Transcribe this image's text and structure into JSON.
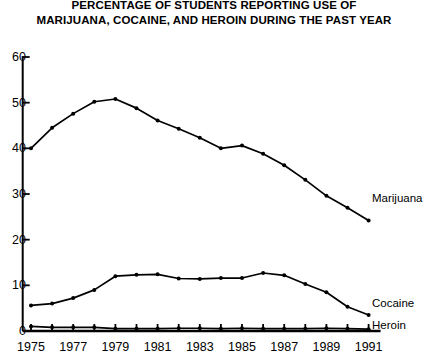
{
  "chart_data": {
    "type": "line",
    "title": "PERCENTAGE OF STUDENTS REPORTING USE OF MARIJUANA, COCAINE, AND HEROIN DURING THE PAST YEAR",
    "title_line1": "PERCENTAGE OF STUDENTS REPORTING USE OF",
    "title_line2": "MARIJUANA, COCAINE, AND HEROIN DURING THE PAST YEAR",
    "xlabel": "",
    "ylabel": "",
    "xlim": [
      1975,
      1991
    ],
    "ylim": [
      0,
      60
    ],
    "grid": false,
    "legend_position": "right-inline",
    "y_ticks": [
      0,
      10,
      20,
      30,
      40,
      50,
      60
    ],
    "y_tick_labels": [
      "0",
      "10",
      "20",
      "30",
      "40",
      "50",
      "60"
    ],
    "x_ticks": [
      1975,
      1976,
      1977,
      1978,
      1979,
      1980,
      1981,
      1982,
      1983,
      1984,
      1985,
      1986,
      1987,
      1988,
      1989,
      1990,
      1991
    ],
    "x_tick_labels_shown": [
      "1975",
      "1977",
      "1979",
      "1981",
      "1983",
      "1985",
      "1987",
      "1989",
      "1991"
    ],
    "x": [
      1975,
      1976,
      1977,
      1978,
      1979,
      1980,
      1981,
      1982,
      1983,
      1984,
      1985,
      1986,
      1987,
      1988,
      1989,
      1990,
      1991
    ],
    "series": [
      {
        "name": "Marijuana",
        "label": "Marijuana",
        "color": "#000000",
        "marker": "dot",
        "values": [
          40.0,
          44.5,
          47.6,
          50.2,
          50.8,
          48.8,
          46.1,
          44.3,
          42.3,
          40.0,
          40.6,
          38.8,
          36.3,
          33.1,
          29.6,
          27.0,
          24.2
        ]
      },
      {
        "name": "Cocaine",
        "label": "Cocaine",
        "color": "#000000",
        "marker": "dot",
        "values": [
          5.6,
          6.0,
          7.2,
          9.0,
          12.0,
          12.3,
          12.4,
          11.5,
          11.4,
          11.6,
          11.6,
          12.7,
          12.2,
          10.3,
          8.5,
          5.3,
          3.5
        ]
      },
      {
        "name": "Heroin",
        "label": "Heroin",
        "color": "#000000",
        "marker": "dot",
        "values": [
          1.0,
          0.8,
          0.8,
          0.8,
          0.5,
          0.5,
          0.5,
          0.6,
          0.6,
          0.5,
          0.6,
          0.5,
          0.5,
          0.5,
          0.6,
          0.5,
          0.4
        ]
      }
    ]
  }
}
